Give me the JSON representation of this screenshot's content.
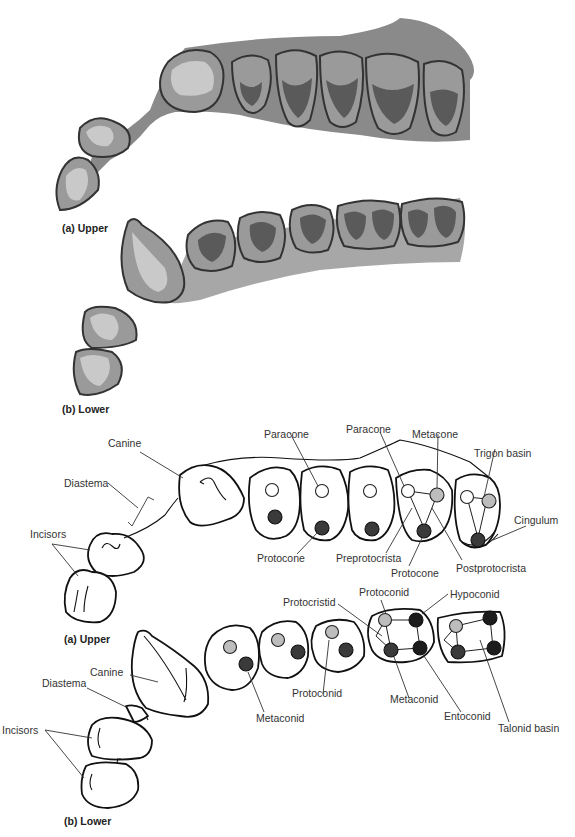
{
  "figure": {
    "panels": {
      "illustration_upper_caption": "(a) Upper",
      "illustration_lower_caption": "(b) Lower",
      "diagram_upper_caption": "(a) Upper",
      "diagram_lower_caption": "(b) Lower"
    },
    "upper_labels": {
      "canine": "Canine",
      "diastema": "Diastema",
      "incisors": "Incisors",
      "paracone_1": "Paracone",
      "paracone_2": "Paracone",
      "metacone": "Metacone",
      "trigon_basin": "Trigon basin",
      "cingulum": "Cingulum",
      "protocone_1": "Protocone",
      "preprotocrista": "Preprotocrista",
      "protocone_2": "Protocone",
      "postprotocrista": "Postprotocrista"
    },
    "lower_labels": {
      "canine": "Canine",
      "diastema": "Diastema",
      "incisors": "Incisors",
      "protocristid": "Protocristid",
      "protoconid_1": "Protoconid",
      "hypoconid": "Hypoconid",
      "metaconid_1": "Metaconid",
      "protoconid_2": "Protoconid",
      "metaconid_2": "Metaconid",
      "entoconid": "Entoconid",
      "talonid_basin": "Talonid basin"
    },
    "legend_colors": {
      "white_cusp": "#ffffff",
      "gray_cusp": "#bdbdbd",
      "dark_cusp": "#3a3a3a"
    }
  }
}
